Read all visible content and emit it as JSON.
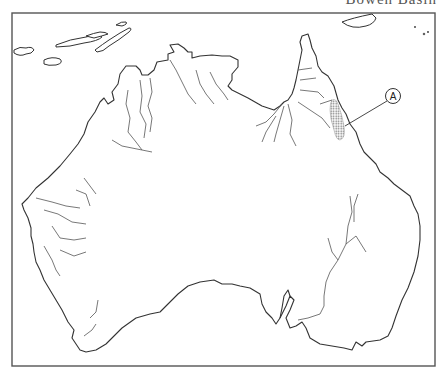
{
  "map": {
    "title": "Bowen Basin",
    "region": "Australia",
    "marker": {
      "label": "A",
      "description": "shaded region in north-east Queensland",
      "hatch_color": "#777777"
    },
    "colors": {
      "background": "#ffffff",
      "coastline": "#333333",
      "rivers": "#555555",
      "frame": "#555555"
    }
  }
}
